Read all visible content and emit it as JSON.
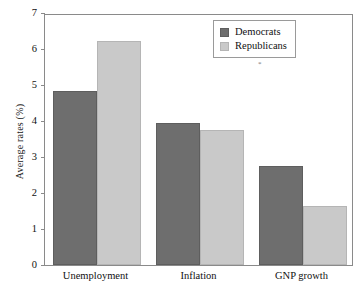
{
  "chart_data": {
    "type": "bar",
    "title": "",
    "xlabel": "",
    "ylabel": "Average rates (%)",
    "categories": [
      "Unemployment",
      "Inflation",
      "GNP growth"
    ],
    "series": [
      {
        "name": "Democrats",
        "color": "#6e6e6e",
        "values": [
          4.83,
          3.95,
          2.76
        ]
      },
      {
        "name": "Republicans",
        "color": "#c9c9c9",
        "values": [
          6.23,
          3.76,
          1.64
        ]
      }
    ],
    "ylim": [
      0,
      7
    ],
    "yticks": [
      "0",
      "1",
      "2",
      "3",
      "4",
      "5",
      "6",
      "7"
    ],
    "grid": false,
    "legend_position": "top-right",
    "annotations": [
      "*"
    ]
  }
}
